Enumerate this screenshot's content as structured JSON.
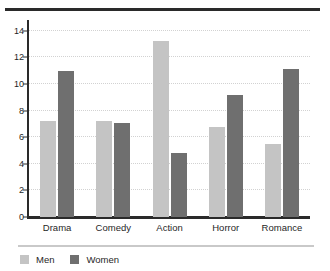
{
  "chart_data": {
    "type": "bar",
    "title": "",
    "subtitle": "",
    "xlabel": "",
    "ylabel": "",
    "categories": [
      "Drama",
      "Comedy",
      "Action",
      "Horror",
      "Romance"
    ],
    "series": [
      {
        "name": "Men",
        "color": "#c4c4c4",
        "values": [
          7.2,
          7.25,
          13.2,
          6.75,
          5.45
        ]
      },
      {
        "name": "Women",
        "color": "#6f6f6f",
        "values": [
          11.0,
          7.05,
          4.8,
          9.15,
          11.1
        ]
      }
    ],
    "ylim": [
      0,
      14.8
    ],
    "yticks": [
      0,
      2,
      4,
      6,
      8,
      10,
      12,
      14
    ],
    "ytick_labels": [
      "0",
      "2",
      "4",
      "6",
      "8",
      "10",
      "12",
      "14"
    ],
    "grid": true,
    "grid_axis": "y",
    "grid_style": "dotted",
    "legend_position": "bottom-left",
    "annotations": []
  },
  "figure": {
    "background": "#ffffff",
    "axis_color": "#2a2a2a",
    "grid_color": "#d2d2d2",
    "top_rule_color": "#2a2a2a",
    "legend_rule_color": "#c9c9c9"
  }
}
